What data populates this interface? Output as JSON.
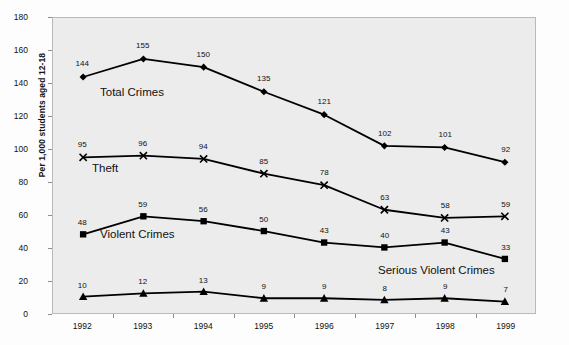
{
  "chart_data": {
    "type": "line",
    "title": "",
    "xlabel": "",
    "ylabel": "Per 1,000 students aged 12-18",
    "categories": [
      "1992",
      "1993",
      "1994",
      "1995",
      "1996",
      "1997",
      "1998",
      "1999"
    ],
    "ylim": [
      0,
      180
    ],
    "ytick_step": 20,
    "yticks": [
      "180",
      "160",
      "140",
      "120",
      "100",
      "80",
      "60",
      "40",
      "20",
      "0"
    ],
    "grid": false,
    "legend_position": "inline-annotations",
    "series": [
      {
        "name": "Total Crimes",
        "marker": "diamond",
        "color": "#000000",
        "values": [
          144,
          155,
          150,
          135,
          121,
          102,
          101,
          92
        ],
        "annotation": "Total Crimes"
      },
      {
        "name": "Theft",
        "marker": "x",
        "color": "#000000",
        "values": [
          95,
          96,
          94,
          85,
          78,
          63,
          58,
          59
        ],
        "annotation": "Theft"
      },
      {
        "name": "Violent Crimes",
        "marker": "square",
        "color": "#000000",
        "values": [
          48,
          59,
          56,
          50,
          43,
          40,
          43,
          33
        ],
        "annotation": "Violent Crimes"
      },
      {
        "name": "Serious Violent Crimes",
        "marker": "triangle",
        "color": "#000000",
        "values": [
          10,
          12,
          13,
          9,
          9,
          8,
          9,
          7
        ],
        "annotation": "Serious Violent Crimes"
      }
    ]
  },
  "style": {
    "plot_background": "#ececec",
    "page_background": "#fdfdfd",
    "axis_color": "#8e8e8e",
    "line_color": "#000000"
  }
}
